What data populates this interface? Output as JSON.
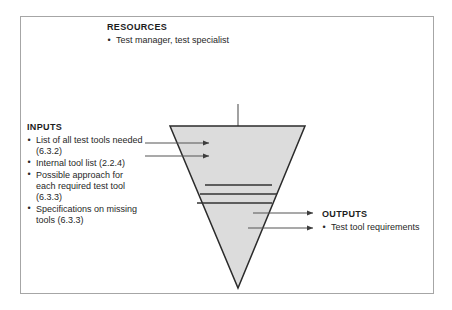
{
  "figure": {
    "kind": "inverted-triangle-process-diagram",
    "frame_border_color": "#a6a6a6",
    "triangle_fill_color": "#dcdcdc",
    "triangle_stroke_color": "#2b2b2b",
    "arrow_color": "#4a4a4a"
  },
  "resources": {
    "heading": "RESOURCES",
    "items": [
      "Test manager, test specialist"
    ]
  },
  "inputs": {
    "heading": "INPUTS",
    "items": [
      "List of all test tools needed (6.3.2)",
      "Internal tool list (2.2.4)",
      "Possible approach for each required test tool (6.3.3)",
      "Specifications on missing tools (6.3.3)"
    ]
  },
  "outputs": {
    "heading": "OUTPUTS",
    "items": [
      "Test tool requirements"
    ]
  },
  "shape_data": {
    "type": "diagram",
    "triangle": {
      "points": "170,126 305,126 238,288",
      "apex_x": 238,
      "apex_y": 288,
      "top_left_x": 170,
      "top_right_x": 305,
      "top_y": 126
    },
    "internal_lines": [
      {
        "x1": 205,
        "y1": 185,
        "x2": 272,
        "y2": 185
      },
      {
        "x1": 200,
        "y1": 194,
        "x2": 277,
        "y2": 194
      },
      {
        "x1": 197,
        "y1": 203,
        "x2": 272,
        "y2": 203
      }
    ],
    "input_arrows": [
      {
        "x1": 145,
        "y1": 143,
        "x2": 212,
        "y2": 143
      },
      {
        "x1": 145,
        "y1": 156,
        "x2": 212,
        "y2": 156
      }
    ],
    "resource_arrow": {
      "x1": 238,
      "y1": 104,
      "x2": 238,
      "y2": 163
    },
    "output_arrows": [
      {
        "x1": 253,
        "y1": 213,
        "x2": 316,
        "y2": 213
      },
      {
        "x1": 248,
        "y1": 228,
        "x2": 316,
        "y2": 228
      }
    ]
  }
}
